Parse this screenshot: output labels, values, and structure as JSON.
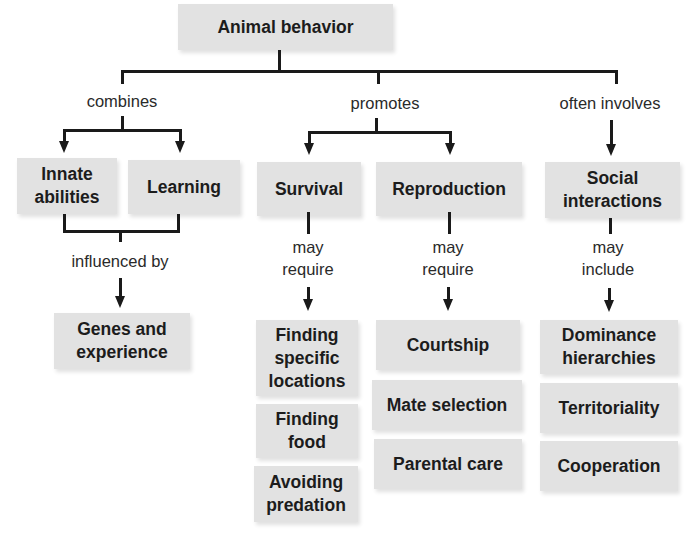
{
  "title": "Animal behavior",
  "branches": {
    "combines": {
      "label": "combines",
      "children": [
        "Innate abilities",
        "Learning"
      ],
      "child_lines": [
        [
          "Innate",
          "abilities"
        ],
        [
          "Learning"
        ]
      ],
      "link": "influenced by",
      "result": [
        "Genes and",
        "experience"
      ]
    },
    "promotes": {
      "label": "promotes",
      "survival": {
        "label": "Survival",
        "link": [
          "may",
          "require"
        ],
        "items": [
          [
            "Finding",
            "specific",
            "locations"
          ],
          [
            "Finding",
            "food"
          ],
          [
            "Avoiding",
            "predation"
          ]
        ]
      },
      "reproduction": {
        "label": "Reproduction",
        "link": [
          "may",
          "require"
        ],
        "items": [
          "Courtship",
          "Mate selection",
          "Parental care"
        ]
      }
    },
    "often_involves": {
      "label": "often involves",
      "social": {
        "label": [
          "Social",
          "interactions"
        ],
        "link": [
          "may",
          "include"
        ],
        "items": [
          [
            "Dominance",
            "hierarchies"
          ],
          [
            "Territoriality"
          ],
          [
            "Cooperation"
          ]
        ]
      }
    }
  },
  "colors": {
    "box_fill": "#e2e2e2",
    "line": "#1a1a1a",
    "text": "#1c1c1c"
  }
}
